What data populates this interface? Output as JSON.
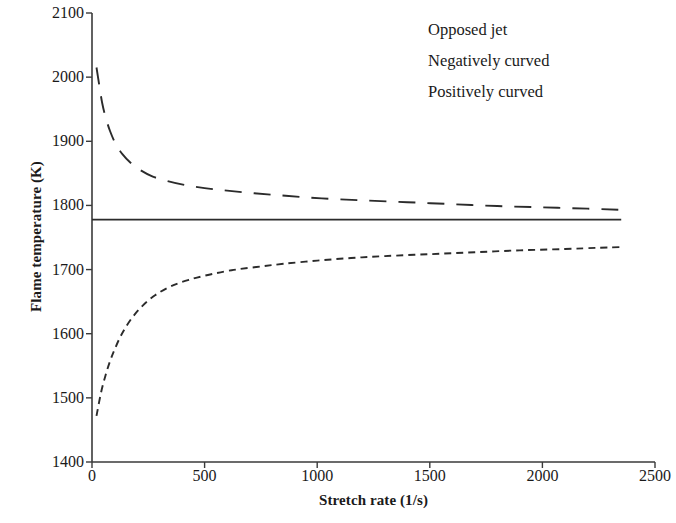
{
  "chart_data": {
    "type": "line",
    "title": "",
    "xlabel": "Stretch rate (1/s)",
    "ylabel": "Flame temperature (K)",
    "xlim": [
      0,
      2500
    ],
    "ylim": [
      1400,
      2100
    ],
    "xticks": [
      0,
      500,
      1000,
      1500,
      2000,
      2500
    ],
    "yticks": [
      1400,
      1500,
      1600,
      1700,
      1800,
      1900,
      2000,
      2100
    ],
    "grid": false,
    "legend_position": "top-right",
    "series": [
      {
        "name": "Opposed jet",
        "style": "solid",
        "color": "#262626",
        "x": [
          0,
          250,
          500,
          750,
          1000,
          1250,
          1500,
          1750,
          2000,
          2200,
          2350
        ],
        "y": [
          1778,
          1778,
          1778,
          1778,
          1778,
          1778,
          1778,
          1778,
          1778,
          1778,
          1778
        ]
      },
      {
        "name": "Negatively curved",
        "style": "short-dash",
        "color": "#2b2b2b",
        "x": [
          20,
          40,
          60,
          80,
          100,
          130,
          170,
          220,
          280,
          350,
          430,
          520,
          620,
          730,
          850,
          1000,
          1150,
          1300,
          1500,
          1700,
          1900,
          2100,
          2250,
          2350
        ],
        "y": [
          1472,
          1508,
          1535,
          1557,
          1575,
          1598,
          1621,
          1642,
          1660,
          1674,
          1684,
          1692,
          1699,
          1704,
          1709,
          1714,
          1718,
          1721,
          1724,
          1727,
          1730,
          1732,
          1734,
          1735
        ]
      },
      {
        "name": "Positively curved",
        "style": "long-dash",
        "color": "#2b2b2b",
        "x": [
          20,
          32,
          45,
          60,
          80,
          105,
          135,
          170,
          215,
          270,
          335,
          410,
          500,
          600,
          720,
          860,
          1020,
          1200,
          1400,
          1600,
          1800,
          2000,
          2200,
          2350
        ],
        "y": [
          2015,
          1988,
          1960,
          1938,
          1916,
          1896,
          1880,
          1867,
          1855,
          1845,
          1838,
          1832,
          1827,
          1823,
          1819,
          1815,
          1811,
          1808,
          1805,
          1802,
          1799,
          1797,
          1795,
          1793
        ]
      }
    ]
  },
  "legend": {
    "items": [
      {
        "label": "Opposed jet",
        "key": "solid-line-key"
      },
      {
        "label": "Negatively curved",
        "key": "short-dashed-line-key"
      },
      {
        "label": "Positively curved",
        "key": "long-dashed-line-key"
      }
    ]
  }
}
